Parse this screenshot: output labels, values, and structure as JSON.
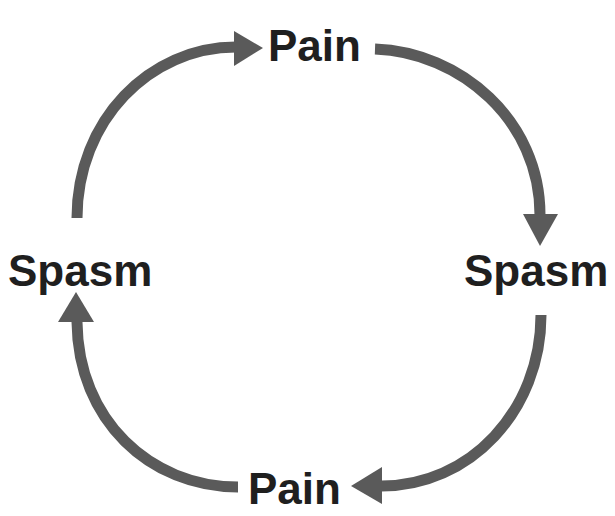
{
  "diagram": {
    "type": "cycle",
    "direction": "clockwise",
    "nodes": {
      "top": {
        "label": "Pain"
      },
      "right": {
        "label": "Spasm"
      },
      "bottom": {
        "label": "Pain"
      },
      "left": {
        "label": "Spasm"
      }
    },
    "edges": [
      {
        "from": "left",
        "to": "top"
      },
      {
        "from": "top",
        "to": "right"
      },
      {
        "from": "right",
        "to": "bottom"
      },
      {
        "from": "bottom",
        "to": "left"
      }
    ],
    "colors": {
      "arrow": "#5a5a5a",
      "text": "#1f1f1f",
      "background": "#ffffff"
    }
  }
}
